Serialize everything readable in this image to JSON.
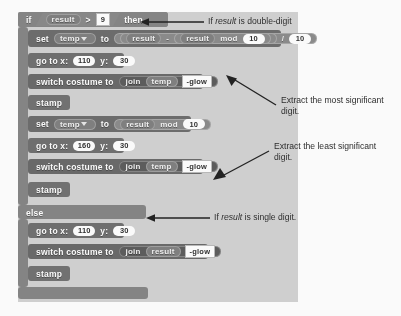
{
  "editor": {
    "name": "scratch-script-canvas",
    "background_color": "#d2d2d2"
  },
  "script": {
    "if_block": {
      "keyword_if": "if",
      "condition": {
        "left": "result",
        "operator": ">",
        "right": "9"
      },
      "keyword_then": "then"
    },
    "else_block": {
      "keyword_else": "else"
    },
    "then_branch": [
      {
        "id": "set-temp-msd",
        "type": "variables",
        "keyword_set": "set",
        "variable": "temp",
        "keyword_to": "to",
        "expression": {
          "left": "result",
          "minus": "-",
          "inner_left": "result",
          "mod": "mod",
          "mod_value": "10",
          "divide": "/",
          "divisor": "10"
        }
      },
      {
        "id": "goto-msd",
        "type": "motion",
        "label": "go to x:",
        "x": "110",
        "label_y": "y:",
        "y": "30"
      },
      {
        "id": "costume-msd",
        "type": "looks",
        "label": "switch costume to",
        "join": "join",
        "join_arg1": "temp",
        "join_arg2": "-glow"
      },
      {
        "id": "stamp-msd",
        "type": "pen",
        "label": "stamp"
      },
      {
        "id": "set-temp-lsd",
        "type": "variables",
        "keyword_set": "set",
        "variable": "temp",
        "keyword_to": "to",
        "expression": {
          "left": "result",
          "mod": "mod",
          "mod_value": "10"
        }
      },
      {
        "id": "goto-lsd",
        "type": "motion",
        "label": "go to x:",
        "x": "160",
        "label_y": "y:",
        "y": "30"
      },
      {
        "id": "costume-lsd",
        "type": "looks",
        "label": "switch costume to",
        "join": "join",
        "join_arg1": "temp",
        "join_arg2": "-glow"
      },
      {
        "id": "stamp-lsd",
        "type": "pen",
        "label": "stamp"
      }
    ],
    "else_branch": [
      {
        "id": "goto-single",
        "type": "motion",
        "label": "go to x:",
        "x": "110",
        "label_y": "y:",
        "y": "30"
      },
      {
        "id": "costume-single",
        "type": "looks",
        "label": "switch costume to",
        "join": "join",
        "join_arg1": "result",
        "join_arg2": "-glow"
      },
      {
        "id": "stamp-single",
        "type": "pen",
        "label": "stamp"
      }
    ]
  },
  "annotations": [
    {
      "id": "note-double-digit",
      "prefix": "If ",
      "emphasis": "result",
      "suffix": " is double-digit"
    },
    {
      "id": "note-most-significant",
      "line1": "Extract the most significant",
      "line2": "digit."
    },
    {
      "id": "note-least-significant",
      "line1": "Extract the least significant",
      "line2": "digit."
    },
    {
      "id": "note-single-digit",
      "prefix": "If ",
      "emphasis": "result",
      "suffix": " is single digit."
    }
  ]
}
